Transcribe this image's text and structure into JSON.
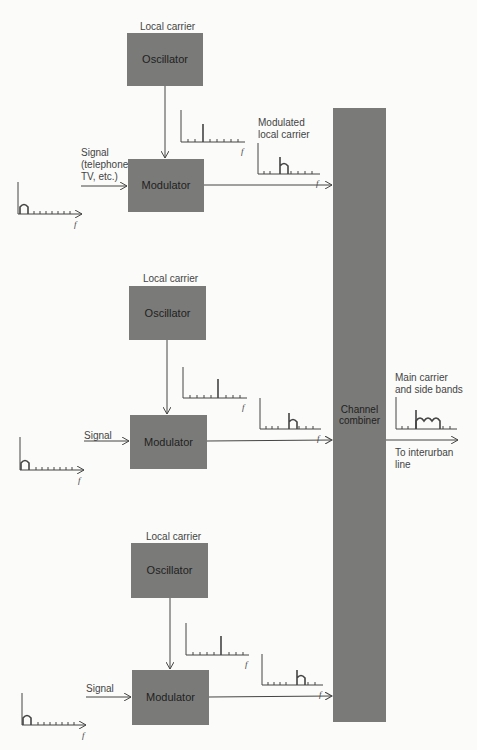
{
  "diagram": {
    "type": "block diagram",
    "channels": [
      {
        "id": 1,
        "carrier_label": "Local carrier",
        "oscillator_label": "Oscillator",
        "modulator_label": "Modulator",
        "signal_label": "Signal\n(telephone,\nTV, etc.)",
        "modulated_label": "Modulated\nlocal carrier",
        "axis_label": "f"
      },
      {
        "id": 2,
        "carrier_label": "Local carrier",
        "oscillator_label": "Oscillator",
        "modulator_label": "Modulator",
        "signal_label": "Signal",
        "modulated_label": "",
        "axis_label": "f"
      },
      {
        "id": 3,
        "carrier_label": "Local carrier",
        "oscillator_label": "Oscillator",
        "modulator_label": "Modulator",
        "signal_label": "Signal",
        "modulated_label": "",
        "axis_label": "f"
      }
    ],
    "combiner_label": "Channel\ncombiner",
    "output_spectrum_label": "Main carrier\nand side bands",
    "output_label": "To interurban\nline",
    "axis_label": "f",
    "colors": {
      "block_fill": "#7a7a78",
      "line": "#444444",
      "background": "#fbfbf9"
    }
  }
}
